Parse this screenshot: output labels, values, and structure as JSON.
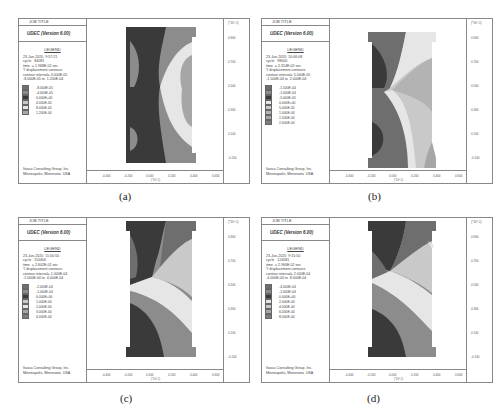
{
  "panels": [
    {
      "id": "a",
      "caption": "(a)",
      "job_title": "JOB TITLE",
      "program": "UDEC (Version 6.00)",
      "legend_title": "LEGEND",
      "info": "23-Jun-2020  9:57:21\ncycle   84081\ntime  = 1.968E-02 sec\nY displacement contours\ncontour interval= 4.000E-05\n-8.000E-05 to  1.200E-04",
      "contours": [
        "-8.000E-05",
        "-4.000E-05",
        "0.000E+00",
        "4.000E-05",
        "8.000E-05",
        "1.200E-04"
      ],
      "company": "Itasca Consulting Group, Inc.\nMinneapolis, Minnesota  USA",
      "y_ticks": [
        "0.900",
        "0.700",
        "0.500",
        "0.300",
        "0.100",
        "-0.100"
      ],
      "y_unit": "(*10^-1)",
      "x_ticks": [
        "-0.400",
        "-0.200",
        "0.000",
        "0.200",
        "0.400",
        "0.600"
      ],
      "x_unit": "(*10^-1)"
    },
    {
      "id": "b",
      "caption": "(b)",
      "job_title": "JOB TITLE",
      "program": "UDEC (Version 6.00)",
      "legend_title": "LEGEND",
      "info": "23-Jun-2020  10:06:08\ncycle   98000\ntime  = 2.314E-02 sec\nY displacement contours\ncontour interval= 5.000E-05\n-1.500E-04 to  2.000E-04",
      "contours": [
        "-1.500E-04",
        "-1.000E-04",
        "-5.000E-05",
        "0.000E+00",
        "5.000E-05",
        "1.000E-04",
        "1.500E-04",
        "2.000E-04"
      ],
      "company": "Itasca Consulting Group, Inc.\nMinneapolis, Minnesota  USA",
      "y_ticks": [
        "0.900",
        "0.700",
        "0.500",
        "0.300",
        "0.100",
        "-0.100"
      ],
      "y_unit": "(*10^-1)",
      "x_ticks": [
        "-0.400",
        "-0.200",
        "0.000",
        "0.200",
        "0.400",
        "0.600"
      ],
      "x_unit": "(*10^-1)"
    },
    {
      "id": "c",
      "caption": "(c)",
      "job_title": "JOB TITLE",
      "program": "UDEC (Version 6.00)",
      "legend_title": "LEGEND",
      "info": "23-Jun-2020  11:00:50\ncycle   110400\ntime  = 2.602E-02 sec\nY displacement contours\ncontour interval= 1.000E-04\n-2.000E-04 to  4.000E-04",
      "contours": [
        "-2.000E-04",
        "-1.000E-04",
        "0.000E+00",
        "1.000E-04",
        "2.000E-04",
        "3.000E-04",
        "4.000E-04"
      ],
      "company": "Itasca Consulting Group, Inc.\nMinneapolis, Minnesota  USA",
      "y_ticks": [
        "0.900",
        "0.700",
        "0.500",
        "0.300",
        "0.100",
        "-0.100"
      ],
      "y_unit": "(*10^-1)",
      "x_ticks": [
        "-0.400",
        "-0.200",
        "0.000",
        "0.200",
        "0.400",
        "0.600"
      ],
      "x_unit": "(*10^-1)"
    },
    {
      "id": "d",
      "caption": "(d)",
      "job_title": "JOB TITLE",
      "program": "UDEC (Version 6.00)",
      "legend_title": "LEGEND",
      "info": "23-Jun-2020  9:15:50\ncycle   124081\ntime  = 2.960E-02 sec\nY displacement contours\ncontour interval= 2.000E-04\n-4.000E-04 to  8.000E-04",
      "contours": [
        "-4.000E-04",
        "-2.000E-04",
        "0.000E+00",
        "2.000E-04",
        "4.000E-04",
        "6.000E-04",
        "8.000E-04"
      ],
      "company": "Itasca Consulting Group, Inc.\nMinneapolis, Minnesota  USA",
      "y_ticks": [
        "0.900",
        "0.700",
        "0.500",
        "0.300",
        "0.100",
        "-0.100"
      ],
      "y_unit": "(*10^-1)",
      "x_ticks": [
        "-0.400",
        "-0.200",
        "0.000",
        "0.200",
        "0.400",
        "0.600"
      ],
      "x_unit": "(*10^-1)"
    }
  ],
  "colors": {
    "c1": "#6e6e6e",
    "c2": "#8c8c8c",
    "c3": "#3a3a3a",
    "c4": "#c9c9c9",
    "c5": "#e6e6e6",
    "c6": "#a6a6a6",
    "c7": "#7d7d7d",
    "c8": "#b3b3b3"
  }
}
